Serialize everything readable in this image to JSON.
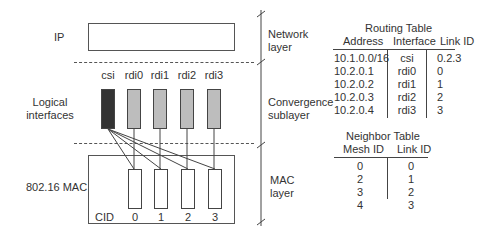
{
  "left_labels": {
    "ip": "IP",
    "logical_interfaces": [
      "Logical",
      "interfaces"
    ],
    "mac": "802.16 MAC"
  },
  "interfaces": [
    {
      "label": "csi",
      "fill": "#333333"
    },
    {
      "label": "rdi0",
      "fill": "#bdbdbd"
    },
    {
      "label": "rdi1",
      "fill": "#bdbdbd"
    },
    {
      "label": "rdi2",
      "fill": "#bdbdbd"
    },
    {
      "label": "rdi3",
      "fill": "#bdbdbd"
    }
  ],
  "cid": {
    "label": "CID",
    "values": [
      "0",
      "1",
      "2",
      "3"
    ]
  },
  "layers": [
    {
      "lines": [
        "Network",
        "layer"
      ]
    },
    {
      "lines": [
        "Convergence",
        "sublayer"
      ]
    },
    {
      "lines": [
        "MAC",
        "layer"
      ]
    }
  ],
  "routing_table": {
    "title": "Routing Table",
    "headers": [
      "Address",
      "Interface",
      "Link ID"
    ],
    "rows": [
      [
        "10.1.0.0/16",
        "csi",
        "0.2.3"
      ],
      [
        "10.2.0.1",
        "rdi0",
        "0"
      ],
      [
        "10.2.0.2",
        "rdi1",
        "1"
      ],
      [
        "10.2.0.3",
        "rdi2",
        "2"
      ],
      [
        "10.2.0.4",
        "rdi3",
        "3"
      ]
    ]
  },
  "neighbor_table": {
    "title": "Neighbor Table",
    "headers": [
      "Mesh ID",
      "Link ID"
    ],
    "rows": [
      [
        "0",
        "0"
      ],
      [
        "2",
        "1"
      ],
      [
        "3",
        "2"
      ],
      [
        "4",
        "3"
      ]
    ]
  }
}
